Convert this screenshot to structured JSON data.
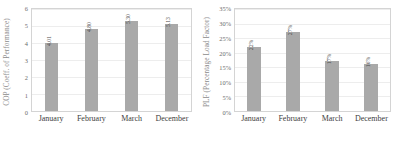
{
  "chart_data": [
    {
      "type": "bar",
      "panel": "left",
      "title": "",
      "xlabel": "",
      "ylabel": "COP (Coeff. of Performance)",
      "categories": [
        "January",
        "February",
        "March",
        "December"
      ],
      "values": [
        4.01,
        4.8,
        5.3,
        5.13
      ],
      "value_labels": [
        "4.01",
        "4.80",
        "5.30",
        "5.13"
      ],
      "ylim": [
        0,
        6
      ],
      "yticks": [
        0,
        1,
        2,
        3,
        4,
        5,
        6
      ],
      "ytick_labels": [
        "0",
        "1",
        "2",
        "3",
        "4",
        "5",
        "6"
      ],
      "grid": true,
      "legend": "none",
      "bar_color": "#a9a9a9"
    },
    {
      "type": "bar",
      "panel": "right",
      "title": "",
      "xlabel": "",
      "ylabel": "PLF (Percentage Load Factor)",
      "categories": [
        "January",
        "February",
        "March",
        "December"
      ],
      "values": [
        22,
        27,
        17,
        16
      ],
      "value_labels": [
        "22%",
        "27%",
        "17%",
        "16%"
      ],
      "ylim": [
        0,
        35
      ],
      "yticks": [
        0,
        5,
        10,
        15,
        20,
        25,
        30,
        35
      ],
      "ytick_labels": [
        "0%",
        "5%",
        "10%",
        "15%",
        "20%",
        "25%",
        "30%",
        "35%"
      ],
      "grid": true,
      "legend": "none",
      "bar_color": "#a9a9a9"
    }
  ]
}
